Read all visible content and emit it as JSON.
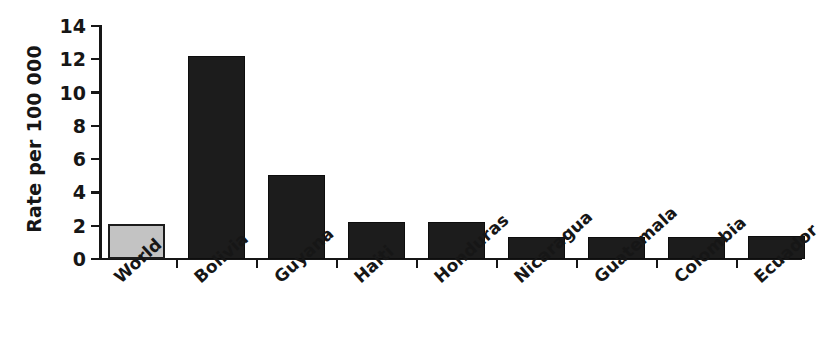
{
  "chart_data": {
    "type": "bar",
    "title": "",
    "subtitle": "",
    "xlabel": "",
    "ylabel": "Rate per 100 000",
    "categories": [
      "World",
      "Bolivia",
      "Guyana",
      "Haiti",
      "Honduras",
      "Nicaragua",
      "Guatemala",
      "Colombia",
      "Ecuador"
    ],
    "values": [
      2.1,
      12.2,
      5.05,
      2.2,
      2.2,
      1.3,
      1.35,
      1.35,
      1.4
    ],
    "series": [
      {
        "name": "Rate per 100 000",
        "values": [
          2.1,
          12.2,
          5.05,
          2.2,
          2.2,
          1.3,
          1.35,
          1.35,
          1.4
        ]
      }
    ],
    "bar_colors": [
      "#c3c3c3",
      "#1c1c1c",
      "#1c1c1c",
      "#1c1c1c",
      "#1c1c1c",
      "#1c1c1c",
      "#1c1c1c",
      "#1c1c1c",
      "#1c1c1c"
    ],
    "ylim": [
      0,
      14
    ],
    "ytick_values": [
      0,
      2,
      4,
      6,
      8,
      10,
      12,
      14
    ],
    "ytick_labels": [
      "0",
      "2",
      "4",
      "6",
      "8",
      "10",
      "12",
      "14"
    ],
    "grid": false,
    "legend": "none",
    "annotations": []
  },
  "axis": {
    "y_title": "Rate per 100 000",
    "ticks": [
      {
        "label": "14",
        "value": 14
      },
      {
        "label": "12",
        "value": 12
      },
      {
        "label": "10",
        "value": 10
      },
      {
        "label": "8",
        "value": 8
      },
      {
        "label": "6",
        "value": 6
      },
      {
        "label": "4",
        "value": 4
      },
      {
        "label": "2",
        "value": 2
      },
      {
        "label": "0",
        "value": 0
      }
    ]
  },
  "bars": [
    {
      "label": "World",
      "value": 2.1,
      "color": "#c3c3c3",
      "style": "light"
    },
    {
      "label": "Bolivia",
      "value": 12.2,
      "color": "#1c1c1c",
      "style": "dark"
    },
    {
      "label": "Guyana",
      "value": 5.05,
      "color": "#1c1c1c",
      "style": "dark"
    },
    {
      "label": "Haiti",
      "value": 2.2,
      "color": "#1c1c1c",
      "style": "dark"
    },
    {
      "label": "Honduras",
      "value": 2.2,
      "color": "#1c1c1c",
      "style": "dark"
    },
    {
      "label": "Nicaragua",
      "value": 1.3,
      "color": "#1c1c1c",
      "style": "dark"
    },
    {
      "label": "Guatemala",
      "value": 1.35,
      "color": "#1c1c1c",
      "style": "dark"
    },
    {
      "label": "Colombia",
      "value": 1.35,
      "color": "#1c1c1c",
      "style": "dark"
    },
    {
      "label": "Ecuador",
      "value": 1.4,
      "color": "#1c1c1c",
      "style": "dark"
    }
  ]
}
